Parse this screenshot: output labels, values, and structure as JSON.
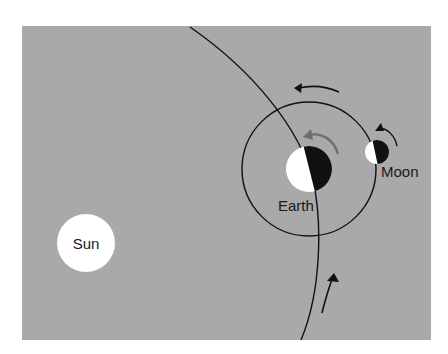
{
  "diagram": {
    "type": "astronomy-orbit-diagram",
    "colors": {
      "page_background": "#ffffff",
      "panel_background": "#a9a9a9",
      "line": "#111111",
      "body_light": "#ffffff",
      "body_dark": "#111111",
      "earth_rotation_arrow": "#6e6e6e",
      "label_text": "#1a1a1a"
    },
    "labels": {
      "sun": "Sun",
      "earth": "Earth",
      "moon": "Moon"
    },
    "bodies": [
      {
        "name": "Sun",
        "cx": 86,
        "cy": 243,
        "r": 29,
        "fill": "#ffffff"
      },
      {
        "name": "Earth",
        "cx": 309,
        "cy": 169,
        "r": 23,
        "lit_side": "left"
      },
      {
        "name": "Moon",
        "cx": 377,
        "cy": 152,
        "r": 12,
        "lit_side": "left"
      }
    ],
    "orbits": [
      {
        "name": "earth-orbit-around-sun",
        "kind": "large-arc",
        "from": [
          190,
          27
        ],
        "to": [
          301,
          340
        ]
      },
      {
        "name": "moon-orbit-around-earth",
        "kind": "circle",
        "cx": 309,
        "cy": 169,
        "r": 67
      }
    ],
    "arrows": [
      {
        "name": "moon-orbit-direction",
        "direction": "counterclockwise",
        "position": "above-moon-orbit"
      },
      {
        "name": "earth-rotation-direction",
        "direction": "counterclockwise",
        "color": "gray"
      },
      {
        "name": "moon-rotation-direction",
        "direction": "counterclockwise"
      },
      {
        "name": "earth-orbit-direction",
        "direction": "upward-along-orbit"
      }
    ]
  }
}
